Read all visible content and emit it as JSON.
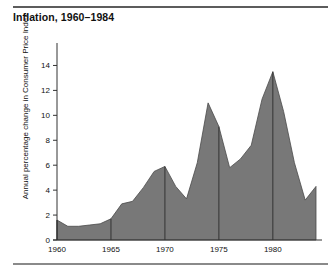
{
  "figure": {
    "title": "Inflation, 1960–1984",
    "rule_color": "#5c5c5c"
  },
  "chart_data": {
    "type": "area",
    "title": "Inflation, 1960–1984",
    "xlabel": "",
    "ylabel": "Annual percentage change in Consumer Price Index",
    "x": [
      1960,
      1961,
      1962,
      1963,
      1964,
      1965,
      1966,
      1967,
      1968,
      1969,
      1970,
      1971,
      1972,
      1973,
      1974,
      1975,
      1976,
      1977,
      1978,
      1979,
      1980,
      1981,
      1982,
      1983,
      1984
    ],
    "values": [
      1.6,
      1.1,
      1.1,
      1.2,
      1.3,
      1.7,
      2.9,
      3.1,
      4.2,
      5.5,
      5.9,
      4.3,
      3.3,
      6.2,
      11.0,
      9.1,
      5.8,
      6.5,
      7.6,
      11.3,
      13.5,
      10.3,
      6.2,
      3.2,
      4.3
    ],
    "xlim": [
      1960,
      1984
    ],
    "ylim": [
      0,
      15
    ],
    "yticks": [
      0,
      2,
      4,
      6,
      8,
      10,
      12,
      14
    ],
    "xticks": [
      1960,
      1965,
      1970,
      1975,
      1980
    ],
    "grid": "vertical-at-xticks",
    "legend": "none",
    "fill_color": "#787878",
    "line_color": "#4a4a4a",
    "axis_color": "#333333"
  }
}
